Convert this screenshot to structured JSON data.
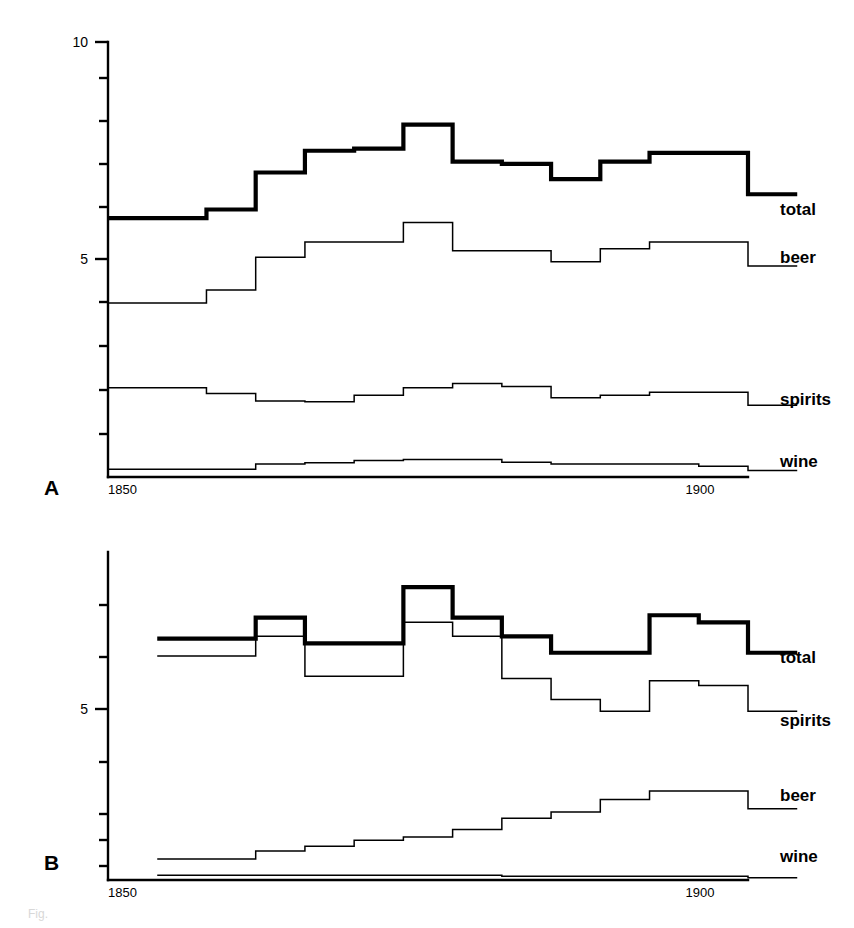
{
  "figure": {
    "panel_a_letter": "A",
    "panel_b_letter": "B",
    "caption": "Fig."
  },
  "chart_data": [
    {
      "type": "line",
      "id": "panel-a",
      "title": "",
      "subtitle": "",
      "panel_label": "A",
      "xlabel": "",
      "ylabel": "",
      "xlim": [
        1850,
        1915
      ],
      "ylim": [
        0,
        10
      ],
      "xticks": [
        1850,
        1900
      ],
      "xtick_labels": [
        "1850",
        "1900"
      ],
      "yticks": [
        0,
        1,
        2,
        3,
        4,
        5,
        6,
        7,
        8,
        9,
        10
      ],
      "ytick_labels": [
        "",
        "",
        "",
        "",
        "",
        "5",
        "",
        "",
        "",
        "",
        "10"
      ],
      "grid": false,
      "legend_position": "right",
      "step_style": "post",
      "x": [
        1850,
        1855,
        1860,
        1865,
        1870,
        1875,
        1880,
        1885,
        1890,
        1895,
        1900,
        1905,
        1910,
        1915
      ],
      "series": [
        {
          "name": "total",
          "style": "thick",
          "values": [
            5.95,
            5.95,
            6.15,
            7.0,
            7.5,
            7.55,
            8.1,
            7.25,
            7.2,
            6.85,
            7.25,
            7.45,
            7.45,
            6.5
          ]
        },
        {
          "name": "beer",
          "style": "thin",
          "values": [
            4.0,
            4.0,
            4.3,
            5.05,
            5.4,
            5.4,
            5.85,
            5.2,
            5.2,
            4.95,
            5.25,
            5.4,
            5.4,
            4.85
          ]
        },
        {
          "name": "spirits",
          "style": "thin",
          "values": [
            2.05,
            2.05,
            1.92,
            1.75,
            1.73,
            1.88,
            2.05,
            2.15,
            2.08,
            1.82,
            1.88,
            1.95,
            1.95,
            1.65
          ]
        },
        {
          "name": "wine",
          "style": "thin",
          "values": [
            0.18,
            0.18,
            0.18,
            0.3,
            0.33,
            0.38,
            0.4,
            0.4,
            0.34,
            0.3,
            0.3,
            0.3,
            0.25,
            0.15
          ]
        }
      ]
    },
    {
      "type": "line",
      "id": "panel-b",
      "title": "",
      "subtitle": "",
      "panel_label": "B",
      "xlabel": "",
      "ylabel": "",
      "xlim": [
        1850,
        1915
      ],
      "ylim": [
        0,
        7
      ],
      "xticks": [
        1850,
        1900
      ],
      "xtick_labels": [
        "1850",
        "1900"
      ],
      "yticks": [
        0,
        1,
        2,
        3,
        4,
        5,
        6,
        7
      ],
      "ytick_labels": [
        "",
        "",
        "",
        "",
        "",
        "5",
        "",
        ""
      ],
      "grid": false,
      "legend_position": "right",
      "step_style": "post",
      "x": [
        1855,
        1860,
        1865,
        1870,
        1875,
        1880,
        1885,
        1890,
        1895,
        1900,
        1905,
        1910,
        1915
      ],
      "series": [
        {
          "name": "total",
          "style": "thick",
          "values": [
            5.15,
            5.15,
            5.6,
            5.05,
            5.05,
            6.25,
            5.6,
            5.2,
            4.85,
            4.85,
            5.65,
            5.5,
            4.85
          ]
        },
        {
          "name": "spirits",
          "style": "thin",
          "values": [
            4.78,
            4.78,
            5.2,
            4.35,
            4.35,
            5.5,
            5.2,
            4.3,
            3.85,
            3.6,
            4.25,
            4.15,
            3.6
          ]
        },
        {
          "name": "beer",
          "style": "thin",
          "values": [
            0.45,
            0.45,
            0.62,
            0.72,
            0.85,
            0.92,
            1.08,
            1.32,
            1.45,
            1.72,
            1.9,
            1.9,
            1.52
          ]
        },
        {
          "name": "wine",
          "style": "thin",
          "values": [
            0.1,
            0.1,
            0.1,
            0.1,
            0.1,
            0.1,
            0.1,
            0.08,
            0.08,
            0.08,
            0.08,
            0.08,
            0.05
          ]
        }
      ]
    }
  ],
  "panel_a": {
    "ytick_label_10": "10",
    "ytick_label_5": "5",
    "xtick_label_1850": "1850",
    "xtick_label_1900": "1900",
    "legend": {
      "total": "total",
      "beer": "beer",
      "spirits": "spirits",
      "wine": "wine"
    }
  },
  "panel_b": {
    "ytick_label_5": "5",
    "xtick_label_1850": "1850",
    "xtick_label_1900": "1900",
    "legend": {
      "total": "total",
      "spirits": "spirits",
      "beer": "beer",
      "wine": "wine"
    }
  },
  "colors": {
    "ink": "#000000",
    "background": "#ffffff"
  }
}
